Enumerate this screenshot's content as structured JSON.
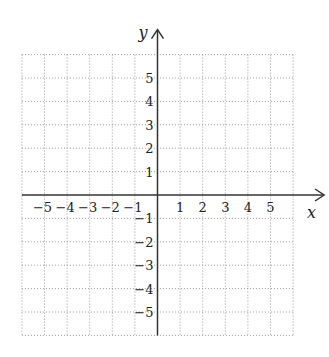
{
  "chart_data": {
    "type": "scatter",
    "title": "",
    "xlabel": "x",
    "ylabel": "y",
    "xlim": [
      -6,
      6
    ],
    "ylim": [
      -6,
      6
    ],
    "grid": true,
    "grid_style": "dotted",
    "x_ticks": [
      -5,
      -4,
      -3,
      -2,
      -1,
      1,
      2,
      3,
      4,
      5
    ],
    "y_ticks": [
      5,
      4,
      3,
      2,
      1,
      -1,
      -2,
      -3,
      -4,
      -5
    ],
    "x_tick_labels": [
      "−5",
      "−4",
      "−3",
      "−2",
      "−1",
      "1",
      "2",
      "3",
      "4",
      "5"
    ],
    "y_tick_labels": [
      "5",
      "4",
      "3",
      "2",
      "1",
      "−1",
      "−2",
      "−3",
      "−4",
      "−5"
    ],
    "series": [],
    "legend": null
  },
  "colors": {
    "axis": "#333333",
    "grid": "#9a9a9a",
    "background": "#ffffff"
  }
}
